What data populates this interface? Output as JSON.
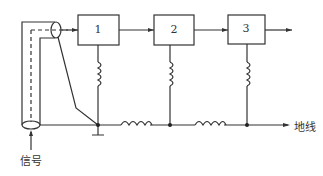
{
  "diagram": {
    "blocks": [
      {
        "id": "1",
        "label": "1"
      },
      {
        "id": "2",
        "label": "2"
      },
      {
        "id": "3",
        "label": "3"
      }
    ],
    "labels": {
      "signal": "信号",
      "ground": "地线"
    },
    "colors": {
      "line": "#333333",
      "background": "#ffffff"
    }
  }
}
